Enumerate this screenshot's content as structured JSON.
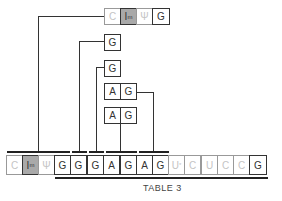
{
  "diagram": {
    "caption": "TABLE 3",
    "top_fragment": [
      {
        "label": "C",
        "style": "faded"
      },
      {
        "label": "I",
        "sup": "m",
        "style": "shaded"
      },
      {
        "label": "Ψ",
        "style": "faded"
      },
      {
        "label": "G",
        "style": "normal"
      }
    ],
    "fragments": [
      {
        "cells": [
          "G"
        ]
      },
      {
        "cells": [
          "G"
        ]
      },
      {
        "cells": [
          "A",
          "G"
        ]
      },
      {
        "cells": [
          "A",
          "G"
        ]
      }
    ],
    "sequence": [
      {
        "label": "C",
        "style": "faded"
      },
      {
        "label": "I",
        "sup": "m",
        "style": "shaded"
      },
      {
        "label": "Ψ",
        "style": "faded"
      },
      {
        "label": "G",
        "style": "normal"
      },
      {
        "label": "G",
        "style": "normal"
      },
      {
        "label": "G",
        "style": "normal"
      },
      {
        "label": "A",
        "style": "normal"
      },
      {
        "label": "G",
        "style": "normal"
      },
      {
        "label": "A",
        "style": "normal"
      },
      {
        "label": "G",
        "style": "normal"
      },
      {
        "label": "U",
        "sup": "*",
        "style": "faded"
      },
      {
        "label": "C",
        "style": "faded"
      },
      {
        "label": "U",
        "style": "faded"
      },
      {
        "label": "C",
        "style": "faded"
      },
      {
        "label": "C",
        "style": "faded"
      },
      {
        "label": "G",
        "style": "normal"
      }
    ]
  }
}
